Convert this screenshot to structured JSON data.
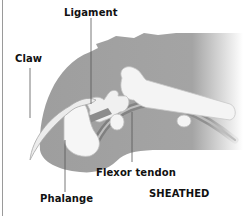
{
  "diagram": {
    "title": "SHEATHED",
    "labels": {
      "ligament": "Ligament",
      "claw": "Claw",
      "flexor_tendon": "Flexor tendon",
      "phalange": "Phalange",
      "state": "SHEATHED"
    },
    "colors": {
      "skin": "#9e9e9e",
      "bone": "#f4f4f4",
      "bone_outline": "#bdbdbd",
      "tendon": "#8a8a8a",
      "leader_line": "#555555",
      "text": "#111111"
    }
  }
}
